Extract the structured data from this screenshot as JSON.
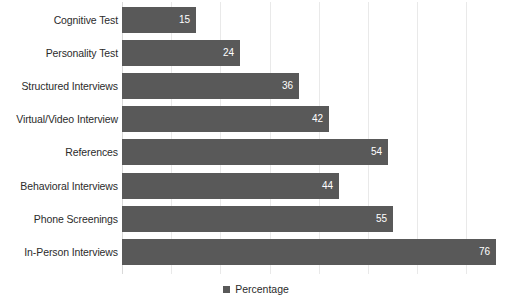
{
  "chart_data": {
    "type": "bar",
    "orientation": "horizontal",
    "title": "",
    "xlabel": "",
    "ylabel": "",
    "categories": [
      "Cognitive Test",
      "Personality Test",
      "Structured Interviews",
      "Virtual/Video Interview",
      "References",
      "Behavioral Interviews",
      "Phone Screenings",
      "In-Person Interviews"
    ],
    "values": [
      15,
      24,
      36,
      42,
      54,
      44,
      55,
      76
    ],
    "series": [
      {
        "name": "Percentage",
        "values": [
          15,
          24,
          36,
          42,
          54,
          44,
          55,
          76
        ]
      }
    ],
    "xlim": [
      0,
      76
    ],
    "grid": true,
    "gridline_interval": 10,
    "gridline_values": [
      10,
      20,
      30,
      40,
      50,
      60,
      70
    ],
    "tick_labels": [],
    "data_labels": [
      "15",
      "24",
      "36",
      "42",
      "54",
      "44",
      "55",
      "76"
    ],
    "legend": {
      "position": "bottom",
      "entries": [
        {
          "label": "Percentage",
          "color": "#595959",
          "marker": "square"
        }
      ]
    },
    "colors": {
      "bar": "#595959",
      "background": "#ffffff",
      "gridline": "#e9e9e9",
      "axis": "#d9d9d9",
      "label_text": "#2b2b2b",
      "value_text": "#ffffff"
    }
  }
}
